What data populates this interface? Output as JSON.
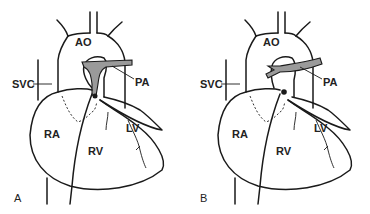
{
  "figure": {
    "panels": [
      {
        "id": "A",
        "panel_label": "A",
        "labels": {
          "aorta": "AO",
          "pulmonary_artery": "PA",
          "svc": "SVC",
          "right_atrium": "RA",
          "right_ventricle": "RV",
          "left_ventricle": "LV"
        }
      },
      {
        "id": "B",
        "panel_label": "B",
        "labels": {
          "aorta": "AO",
          "pulmonary_artery": "PA",
          "svc": "SVC",
          "right_atrium": "RA",
          "right_ventricle": "RV",
          "left_ventricle": "LV"
        }
      }
    ],
    "colors": {
      "line": "#1a1a1a",
      "pulmonary_artery_fill": "#9a9a9a",
      "background": "#ffffff"
    }
  }
}
